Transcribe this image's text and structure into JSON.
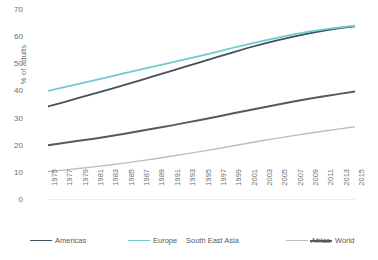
{
  "chart_data": {
    "type": "line",
    "title": "",
    "xlabel": "",
    "ylabel": "% of adults",
    "ylim": [
      0,
      70
    ],
    "ytick_step": 10,
    "yticks": [
      0,
      10,
      20,
      30,
      40,
      50,
      60,
      70
    ],
    "grid": false,
    "legend_position": "bottom",
    "x": [
      1975,
      1977,
      1979,
      1981,
      1983,
      1985,
      1987,
      1989,
      1991,
      1993,
      1995,
      1997,
      1999,
      2001,
      2003,
      2005,
      2007,
      2009,
      2011,
      2013,
      2015
    ],
    "categories": [
      "1975",
      "1977",
      "1979",
      "1981",
      "1983",
      "1985",
      "1987",
      "1989",
      "1991",
      "1993",
      "1995",
      "1997",
      "1999",
      "2001",
      "2003",
      "2005",
      "2007",
      "2009",
      "2011",
      "2013",
      "2015"
    ],
    "series": [
      {
        "name": "Americas",
        "color": "#41525e",
        "width": 1.8,
        "values": [
          34.5,
          36.0,
          37.6,
          39.2,
          40.8,
          42.4,
          44.1,
          45.8,
          47.5,
          49.2,
          50.9,
          52.6,
          54.3,
          56.0,
          57.5,
          58.9,
          60.2,
          61.4,
          62.4,
          63.3,
          64.0
        ]
      },
      {
        "name": "Europe",
        "color": "#6ecbd2",
        "width": 1.8,
        "values": [
          40.2,
          41.5,
          42.8,
          44.1,
          45.4,
          46.7,
          48.0,
          49.3,
          50.6,
          51.9,
          53.2,
          54.6,
          56.0,
          57.3,
          58.6,
          59.8,
          61.0,
          62.0,
          62.9,
          63.6,
          64.2
        ]
      },
      {
        "name": "South East Asia",
        "color": "#ffffff",
        "width": 1.2,
        "values": [
          null,
          null,
          null,
          null,
          null,
          null,
          null,
          null,
          null,
          null,
          null,
          null,
          null,
          null,
          null,
          null,
          null,
          null,
          null,
          null,
          null
        ]
      },
      {
        "name": "Africa",
        "color": "#bcbec0",
        "width": 1.4,
        "values": [
          10.5,
          11.0,
          11.6,
          12.2,
          12.9,
          13.6,
          14.4,
          15.2,
          16.1,
          17.0,
          17.9,
          18.9,
          19.9,
          20.9,
          21.9,
          22.8,
          23.7,
          24.6,
          25.4,
          26.2,
          27.0
        ]
      },
      {
        "name": "World",
        "color": "#58595b",
        "width": 2.0,
        "values": [
          20.2,
          21.0,
          21.8,
          22.6,
          23.5,
          24.4,
          25.4,
          26.4,
          27.4,
          28.5,
          29.6,
          30.7,
          31.9,
          33.0,
          34.1,
          35.2,
          36.3,
          37.3,
          38.2,
          39.1,
          40.0
        ]
      }
    ],
    "axis_color": "#d9d9d9",
    "text_color": "#6d6e71"
  }
}
